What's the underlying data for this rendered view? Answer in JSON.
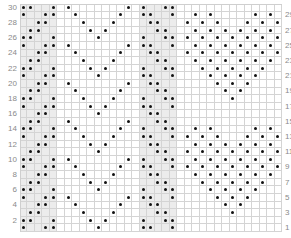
{
  "chart": {
    "rows": 30,
    "columns": 35,
    "shaded_columns": [
      0,
      1,
      2,
      3,
      4,
      16,
      17,
      18,
      19,
      20
    ],
    "colors": {
      "dot": "#111111",
      "grid": "#d4d4d4",
      "shade": "#ececec",
      "label": "#8a8a8a"
    },
    "left_labels": [
      "30",
      "28",
      "26",
      "24",
      "22",
      "20",
      "18",
      "16",
      "14",
      "12",
      "10",
      "8",
      "6",
      "4",
      "2"
    ],
    "left_label_rows": [
      30,
      28,
      26,
      24,
      22,
      20,
      18,
      16,
      14,
      12,
      10,
      8,
      6,
      4,
      2
    ],
    "right_labels": [
      "29",
      "27",
      "25",
      "23",
      "21",
      "19",
      "17",
      "15",
      "13",
      "11",
      "9",
      "7",
      "5",
      "3",
      "1"
    ],
    "right_label_rows": [
      29,
      27,
      25,
      23,
      21,
      19,
      17,
      15,
      13,
      11,
      9,
      7,
      5,
      3,
      1
    ],
    "dots_by_row": {
      "30": [
        0,
        1,
        4,
        6,
        14,
        16,
        19,
        20
      ],
      "29": [
        0,
        3,
        4,
        7,
        13,
        16,
        17,
        20,
        23,
        25,
        31,
        33
      ],
      "28": [
        2,
        3,
        8,
        12,
        17,
        18,
        22,
        24,
        26,
        30,
        32,
        34
      ],
      "27": [
        1,
        2,
        9,
        11,
        18,
        19,
        23,
        25,
        27,
        29,
        31,
        33
      ],
      "26": [
        0,
        1,
        4,
        10,
        16,
        19,
        20,
        22,
        24,
        26,
        28,
        30,
        32,
        34
      ],
      "25": [
        0,
        3,
        4,
        6,
        14,
        16,
        17,
        20,
        23,
        25,
        27,
        29,
        31,
        33
      ],
      "24": [
        2,
        3,
        7,
        13,
        17,
        18,
        22,
        24,
        26,
        28,
        30,
        32,
        34
      ],
      "23": [
        1,
        2,
        8,
        12,
        18,
        19,
        23,
        25,
        27,
        29,
        31,
        33
      ],
      "22": [
        0,
        1,
        4,
        9,
        11,
        16,
        19,
        20,
        24,
        26,
        28,
        30,
        32
      ],
      "21": [
        0,
        3,
        4,
        10,
        16,
        17,
        20,
        25,
        27,
        29,
        31
      ],
      "20": [
        2,
        3,
        6,
        14,
        17,
        18,
        26,
        28,
        30
      ],
      "19": [
        1,
        2,
        7,
        13,
        18,
        19,
        27,
        29
      ],
      "18": [
        0,
        1,
        4,
        8,
        12,
        16,
        19,
        20,
        28
      ],
      "17": [
        0,
        3,
        4,
        9,
        11,
        16,
        17,
        20
      ],
      "16": [
        2,
        3,
        10,
        17,
        18
      ],
      "15": [
        1,
        2,
        6,
        14,
        18,
        19
      ],
      "14": [
        0,
        1,
        4,
        7,
        13,
        16,
        19,
        20,
        23,
        25,
        31,
        33
      ],
      "13": [
        0,
        3,
        4,
        8,
        12,
        16,
        17,
        20,
        22,
        24,
        26,
        30,
        32,
        34
      ],
      "12": [
        2,
        3,
        9,
        11,
        17,
        18,
        23,
        25,
        27,
        29,
        31,
        33
      ],
      "11": [
        1,
        2,
        10,
        18,
        19,
        22,
        24,
        26,
        28,
        30,
        32,
        34
      ],
      "10": [
        0,
        1,
        4,
        6,
        14,
        16,
        19,
        20,
        23,
        25,
        27,
        29,
        31,
        33
      ],
      "9": [
        0,
        3,
        4,
        7,
        13,
        16,
        17,
        20,
        22,
        24,
        26,
        28,
        30,
        32,
        34
      ],
      "8": [
        2,
        3,
        8,
        12,
        17,
        18,
        23,
        25,
        27,
        29,
        31,
        33
      ],
      "7": [
        1,
        2,
        9,
        11,
        18,
        19,
        24,
        26,
        28,
        30,
        32
      ],
      "6": [
        0,
        1,
        4,
        10,
        16,
        19,
        20,
        25,
        27,
        29,
        31
      ],
      "5": [
        0,
        3,
        4,
        6,
        14,
        16,
        17,
        20,
        26,
        28,
        30
      ],
      "4": [
        2,
        3,
        7,
        13,
        17,
        18,
        27,
        29
      ],
      "3": [
        1,
        2,
        8,
        12,
        18,
        19,
        28
      ],
      "2": [
        0,
        1,
        4,
        9,
        11,
        16,
        19,
        20
      ],
      "1": [
        0,
        3,
        4,
        10,
        16,
        17,
        20
      ]
    }
  }
}
